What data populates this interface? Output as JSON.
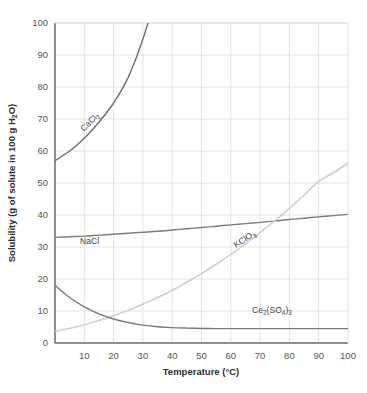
{
  "chart_data": {
    "type": "line",
    "title": "",
    "xlabel": "Temperature (°C)",
    "ylabel": "Solubility (g of solute in 100 g H 2O)",
    "ylabel_parts": {
      "pre": "Solubility (g of solute in 100 g H",
      "sub": "2",
      "post": "O)"
    },
    "xlabel_parts": {
      "pre": "Temperature (°C)"
    },
    "xlim": [
      0,
      100
    ],
    "ylim": [
      0,
      100
    ],
    "grid": true,
    "legend_position": "inline-labels",
    "xticks": [
      10,
      20,
      30,
      40,
      50,
      60,
      70,
      80,
      90,
      100
    ],
    "yticks": [
      0,
      10,
      20,
      30,
      40,
      50,
      60,
      70,
      80,
      90,
      100
    ],
    "x": [
      0,
      5,
      10,
      15,
      20,
      25,
      30,
      35,
      40,
      45,
      50,
      55,
      60,
      65,
      70,
      75,
      80,
      85,
      90,
      95,
      100
    ],
    "series": [
      {
        "name": "CaCl2",
        "label_pre": "CaCl",
        "label_sub": "2",
        "label_post": "",
        "color": "#6e6e6e",
        "width": 1.4,
        "label_x": 84,
        "label_y": 132,
        "label_rotate": -46,
        "values": [
          57,
          60,
          64,
          69,
          75,
          83,
          95,
          110,
          null,
          null,
          null,
          null,
          null,
          null,
          null,
          null,
          null,
          null,
          null,
          null,
          null
        ]
      },
      {
        "name": "NaCl",
        "label_pre": "NaCl",
        "label_sub": "",
        "label_post": "",
        "color": "#7d7d7d",
        "width": 1.4,
        "label_x": 80,
        "label_y": 244,
        "label_rotate": 0,
        "values": [
          33.0,
          33.2,
          33.4,
          33.7,
          34.0,
          34.3,
          34.6,
          34.9,
          35.3,
          35.7,
          36.1,
          36.5,
          36.9,
          37.3,
          37.7,
          38.1,
          38.6,
          39.0,
          39.4,
          39.8,
          40.2
        ]
      },
      {
        "name": "KClO3",
        "label_pre": "KClO",
        "label_sub": "3",
        "label_post": "",
        "color": "#cfcfcf",
        "width": 1.6,
        "label_x": 236,
        "label_y": 248,
        "label_rotate": -33,
        "values": [
          3.6,
          4.6,
          5.7,
          7.0,
          8.5,
          10.2,
          12.1,
          14.2,
          16.5,
          19.0,
          21.7,
          24.6,
          27.7,
          31.0,
          34.5,
          38.2,
          42.1,
          46.2,
          50.5,
          53.2,
          56.2
        ]
      },
      {
        "name": "Ce2(SO4)3",
        "label_pre": "Ce",
        "label_sub": "2",
        "label_mid": "(SO",
        "label_sub2": "4",
        "label_post": ")",
        "label_sub3": "3",
        "color": "#7a7a7a",
        "width": 1.4,
        "label_x": 252,
        "label_y": 313,
        "label_rotate": 0,
        "values": [
          18.0,
          14.2,
          11.3,
          9.1,
          7.5,
          6.4,
          5.6,
          5.1,
          4.8,
          4.65,
          4.55,
          4.5,
          4.5,
          4.5,
          4.5,
          4.5,
          4.5,
          4.5,
          4.5,
          4.5,
          4.5
        ]
      }
    ],
    "colors": {
      "grid": "#e3e3e3",
      "axis": "#6a6a6a",
      "background": "#ffffff",
      "tick_text": "#555555",
      "title_text": "#2e2e2e"
    }
  }
}
